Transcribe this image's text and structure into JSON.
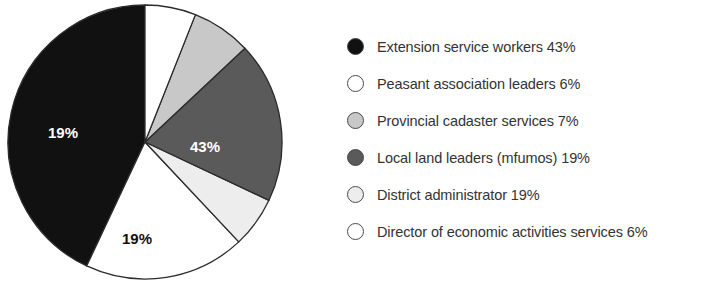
{
  "chart_data": {
    "type": "pie",
    "title": "",
    "subtitle": "",
    "xlabel": "",
    "ylabel": "",
    "grid": false,
    "legend_position": "right",
    "start_angle_deg": 0,
    "direction": "counterclockwise",
    "categories": [
      "Extension service workers",
      "Peasant association leaders",
      "Provincial cadaster services",
      "Local land leaders (mfumos)",
      "District administrator",
      "Director of economic activities services"
    ],
    "values": [
      43,
      6,
      7,
      19,
      19,
      6
    ],
    "value_unit": "%",
    "colors": [
      "#111111",
      "#ffffff",
      "#c8c8c8",
      "#5a5a5a",
      "#ededed",
      "#ffffff"
    ],
    "slices": [
      {
        "name": "Extension service workers",
        "value": 43,
        "data_label": "43%",
        "color": "#111111",
        "label_color": "#ffffff",
        "label_x": 205,
        "label_y": 148
      },
      {
        "name": "Peasant association leaders",
        "value": 19,
        "data_label": "19%",
        "color": "#ffffff",
        "label_color": "#111111",
        "label_x": 137,
        "label_y": 240
      },
      {
        "name": "Provincial cadaster services",
        "value": 6,
        "data_label": "6%",
        "color": "#ededed",
        "label_color": "#111111",
        "label_x": 54,
        "label_y": 209
      },
      {
        "name": "Local land leaders (mfumos)",
        "value": 19,
        "data_label": "19%",
        "color": "#5a5a5a",
        "label_color": "#ffffff",
        "label_x": 63,
        "label_y": 134
      },
      {
        "name": "District administrator",
        "value": 7,
        "data_label": "7%",
        "color": "#c8c8c8",
        "label_color": "#111111",
        "label_x": 88,
        "label_y": 53
      },
      {
        "name": "Director of economic activities services",
        "value": 6,
        "data_label": "6%",
        "color": "#ffffff",
        "label_color": "#111111",
        "label_x": 126,
        "label_y": 26
      }
    ],
    "geometry": {
      "center_x": 145,
      "center_y": 142,
      "radius": 137
    }
  },
  "legend": {
    "items": [
      {
        "label": "Extension service workers 43%",
        "swatch_color": "#111111",
        "swatch_name": "legend-swatch-black"
      },
      {
        "label": "Peasant association leaders 6%",
        "swatch_color": "#ffffff",
        "swatch_name": "legend-swatch-white"
      },
      {
        "label": "Provincial cadaster services 7%",
        "swatch_color": "#c8c8c8",
        "swatch_name": "legend-swatch-light-gray"
      },
      {
        "label": "Local land leaders (mfumos) 19%",
        "swatch_color": "#5a5a5a",
        "swatch_name": "legend-swatch-dark-gray"
      },
      {
        "label": "District administrator 19%",
        "swatch_color": "#ededed",
        "swatch_name": "legend-swatch-very-light-gray"
      },
      {
        "label": "Director of economic activities services 6%",
        "swatch_color": "#ffffff",
        "swatch_name": "legend-swatch-white"
      }
    ]
  }
}
